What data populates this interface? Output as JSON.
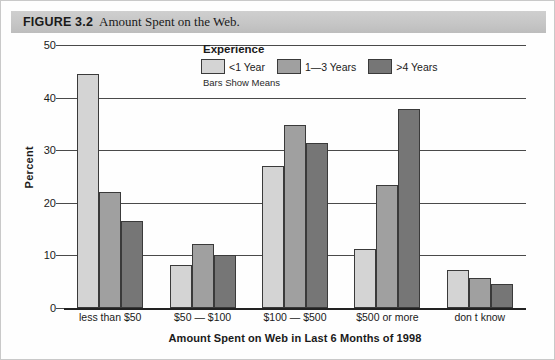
{
  "figure": {
    "label": "FIGURE 3.2",
    "caption": "Amount Spent on the Web."
  },
  "legend": {
    "title": "Experience",
    "note": "Bars Show Means",
    "items": [
      {
        "label": "<1 Year",
        "color": "#d4d4d4"
      },
      {
        "label": "1—3 Years",
        "color": "#a0a0a0"
      },
      {
        "label": ">4 Years",
        "color": "#767676"
      }
    ]
  },
  "chart_data": {
    "type": "bar",
    "title": "Amount Spent on the Web.",
    "xlabel": "Amount Spent on Web in Last 6 Months of 1998",
    "ylabel": "Percent",
    "ylim": [
      0,
      50
    ],
    "yticks": [
      0,
      10,
      20,
      30,
      40,
      50
    ],
    "grid": true,
    "legend_position": "top-center",
    "categories": [
      "less than $50",
      "$50 — $100",
      "$100 — $500",
      "$500 or more",
      "don t know"
    ],
    "series": [
      {
        "name": "<1 Year",
        "color": "#d4d4d4",
        "values": [
          44.5,
          8.2,
          27.0,
          11.3,
          7.2
        ]
      },
      {
        "name": "1—3 Years",
        "color": "#a0a0a0",
        "values": [
          22.1,
          12.1,
          34.7,
          23.4,
          5.8
        ]
      },
      {
        "name": ">4 Years",
        "color": "#767676",
        "values": [
          16.5,
          10.0,
          31.3,
          37.8,
          4.6
        ]
      }
    ]
  }
}
